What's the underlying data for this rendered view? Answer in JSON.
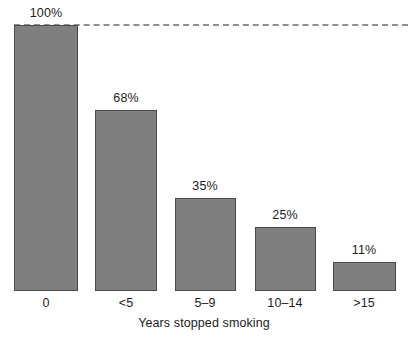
{
  "chart_data": {
    "type": "bar",
    "title": "",
    "subtitle": "",
    "xlabel": "Years stopped smoking",
    "ylabel": "",
    "categories": [
      "0",
      "<5",
      "5–9",
      "10–14",
      ">15"
    ],
    "values": [
      100,
      68,
      35,
      25,
      11
    ],
    "data_labels": [
      "100%",
      "68%",
      "35%",
      "25%",
      "11%"
    ],
    "ylim": [
      0,
      100
    ],
    "grid": false,
    "legend": "none",
    "annotations": [
      {
        "name": "reference-line",
        "kind": "horizontal-dashed-line",
        "value": 100,
        "label": ""
      }
    ],
    "colors": {
      "bar_fill": "#7f7f7f",
      "bar_stroke": "#4a4a4a",
      "reference_line": "#8f8f8f",
      "text": "#1c1c1c",
      "background": "#ffffff"
    },
    "geometry": {
      "baseline_y": 291,
      "top_y": 25,
      "bars": [
        {
          "x": 14,
          "width": 64,
          "top": 25,
          "label_center": 46
        },
        {
          "x": 95,
          "width": 62,
          "top": 110,
          "label_center": 126
        },
        {
          "x": 175,
          "width": 61,
          "top": 198,
          "label_center": 205
        },
        {
          "x": 255,
          "width": 61,
          "top": 227,
          "label_center": 285
        },
        {
          "x": 333,
          "width": 63,
          "top": 262,
          "label_center": 364
        }
      ]
    }
  }
}
